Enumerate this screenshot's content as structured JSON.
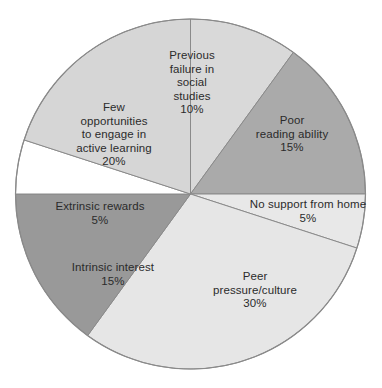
{
  "chart_data": {
    "type": "pie",
    "title": "",
    "subtitle": "",
    "xlabel": "",
    "ylabel": "",
    "grid": false,
    "legend_position": "none",
    "labels_inside_slices": true,
    "start_angle_deg": 0,
    "direction": "clockwise",
    "total_percent": 100,
    "categories": [
      "Previous failure in social studies",
      "Poor reading ability",
      "No support from home",
      "Peer pressure/culture",
      "Intrinsic interest",
      "Extrinsic rewards",
      "Few opportunities to engage in active learning"
    ],
    "values": [
      10,
      15,
      5,
      30,
      15,
      5,
      20
    ],
    "slices": [
      {
        "name": "previous-failure",
        "label": "Previous\nfailure in\nsocial\nstudies",
        "percent_text": "10%",
        "value": 10,
        "color": "#d9d9d9"
      },
      {
        "name": "poor-reading",
        "label": "Poor\nreading ability",
        "percent_text": "15%",
        "value": 15,
        "color": "#aaaaaa"
      },
      {
        "name": "no-support",
        "label": "No support from home",
        "percent_text": "5%",
        "value": 5,
        "color": "#e8e8e8"
      },
      {
        "name": "peer-pressure",
        "label": "Peer\npressure/culture",
        "percent_text": "30%",
        "value": 30,
        "color": "#e6e6e6"
      },
      {
        "name": "intrinsic-interest",
        "label": "Intrinsic interest",
        "percent_text": "15%",
        "value": 15,
        "color": "#999999"
      },
      {
        "name": "extrinsic-rewards",
        "label": "Extrinsic rewards",
        "percent_text": "5%",
        "value": 5,
        "color": "#ffffff"
      },
      {
        "name": "few-opportunities",
        "label": "Few\nopportunities\nto engage in\nactive learning",
        "percent_text": "20%",
        "value": 20,
        "color": "#d6d6d6"
      }
    ]
  },
  "caption": {
    "clipped_text": ""
  },
  "colors": {
    "outline": "#8a8a8a",
    "text": "#2b2b2b",
    "background": "#ffffff"
  }
}
